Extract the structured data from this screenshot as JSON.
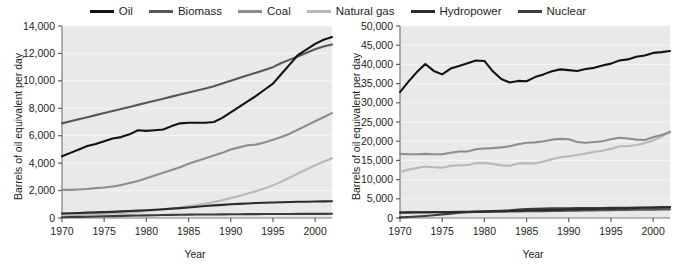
{
  "legend": {
    "items": [
      {
        "label": "Oil",
        "color": "#15110f",
        "name": "legend-item-oil"
      },
      {
        "label": "Biomass",
        "color": "#58565a",
        "name": "legend-item-biomass"
      },
      {
        "label": "Coal",
        "color": "#8e8c90",
        "name": "legend-item-coal"
      },
      {
        "label": "Natural gas",
        "color": "#b9b7bb",
        "name": "legend-item-natural-gas"
      },
      {
        "label": "Hydropower",
        "color": "#2d2a2c",
        "name": "legend-item-hydropower"
      },
      {
        "label": "Nuclear",
        "color": "#3e3c3f",
        "name": "legend-item-nuclear"
      }
    ]
  },
  "chart_data": [
    {
      "type": "line",
      "panel": "left",
      "title": "",
      "xlabel": "Year",
      "ylabel": "Barrels of oil equivalent per day",
      "xlim": [
        1970,
        2002
      ],
      "ylim": [
        0,
        14000
      ],
      "xticks": [
        1970,
        1975,
        1980,
        1985,
        1990,
        1995,
        2000
      ],
      "yticks": [
        0,
        2000,
        4000,
        6000,
        8000,
        10000,
        12000,
        14000
      ],
      "ytick_labels": [
        "0",
        "2,000",
        "4,000",
        "6,000",
        "8,000",
        "10,000",
        "12,000",
        "14,000"
      ],
      "xtick_labels": [
        "1970",
        "1975",
        "1980",
        "1985",
        "1990",
        "1995",
        "2000"
      ],
      "grid": true,
      "legend_position": "top-center",
      "x": [
        1970,
        1971,
        1972,
        1973,
        1974,
        1975,
        1976,
        1977,
        1978,
        1979,
        1980,
        1981,
        1982,
        1983,
        1984,
        1985,
        1986,
        1987,
        1988,
        1989,
        1990,
        1991,
        1992,
        1993,
        1994,
        1995,
        1996,
        1997,
        1998,
        1999,
        2000,
        2001,
        2002
      ],
      "series": [
        {
          "name": "Oil",
          "color": "#15110f",
          "values": [
            4500,
            4750,
            5000,
            5250,
            5400,
            5600,
            5800,
            5900,
            6100,
            6400,
            6350,
            6400,
            6450,
            6700,
            6900,
            6950,
            6950,
            6950,
            7000,
            7300,
            7700,
            8100,
            8500,
            8900,
            9350,
            9800,
            10500,
            11200,
            11900,
            12300,
            12700,
            13000,
            13200
          ]
        },
        {
          "name": "Biomass",
          "color": "#58565a",
          "values": [
            6900,
            7050,
            7200,
            7350,
            7500,
            7650,
            7800,
            7950,
            8100,
            8250,
            8400,
            8550,
            8700,
            8850,
            9000,
            9150,
            9300,
            9450,
            9600,
            9800,
            10000,
            10200,
            10400,
            10600,
            10800,
            11000,
            11300,
            11550,
            11800,
            12050,
            12300,
            12500,
            12650
          ]
        },
        {
          "name": "Coal",
          "color": "#8e8c90",
          "values": [
            2050,
            2050,
            2080,
            2120,
            2180,
            2220,
            2300,
            2400,
            2550,
            2700,
            2900,
            3100,
            3300,
            3500,
            3700,
            3950,
            4150,
            4350,
            4550,
            4750,
            5000,
            5150,
            5300,
            5350,
            5500,
            5700,
            5900,
            6150,
            6450,
            6750,
            7050,
            7350,
            7650
          ]
        },
        {
          "name": "Natural gas",
          "color": "#b9b7bb",
          "values": [
            220,
            230,
            245,
            260,
            280,
            300,
            330,
            360,
            400,
            450,
            500,
            560,
            620,
            690,
            760,
            850,
            950,
            1050,
            1170,
            1300,
            1450,
            1600,
            1780,
            1960,
            2150,
            2380,
            2650,
            2950,
            3250,
            3550,
            3850,
            4100,
            4350
          ]
        },
        {
          "name": "Hydropower",
          "color": "#2d2a2c",
          "values": [
            330,
            350,
            370,
            390,
            410,
            430,
            450,
            480,
            510,
            540,
            570,
            600,
            640,
            680,
            720,
            770,
            820,
            870,
            920,
            960,
            1000,
            1030,
            1060,
            1090,
            1110,
            1130,
            1150,
            1170,
            1180,
            1190,
            1200,
            1210,
            1220
          ]
        },
        {
          "name": "Nuclear",
          "color": "#3e3c3f",
          "values": [
            60,
            70,
            80,
            95,
            110,
            125,
            140,
            155,
            170,
            185,
            195,
            205,
            215,
            225,
            235,
            245,
            250,
            255,
            260,
            265,
            270,
            275,
            280,
            285,
            290,
            292,
            294,
            296,
            298,
            300,
            302,
            304,
            306
          ]
        }
      ]
    },
    {
      "type": "line",
      "panel": "right",
      "title": "",
      "xlabel": "Year",
      "ylabel": "Barrels of oil equivalent per day",
      "xlim": [
        1970,
        2002
      ],
      "ylim": [
        0,
        50000
      ],
      "xticks": [
        1970,
        1975,
        1980,
        1985,
        1990,
        1995,
        2000
      ],
      "yticks": [
        0,
        5000,
        10000,
        15000,
        20000,
        25000,
        30000,
        35000,
        40000,
        45000,
        50000
      ],
      "ytick_labels": [
        "0",
        "5,000",
        "10,000",
        "15,000",
        "20,000",
        "25,000",
        "30,000",
        "35,000",
        "40,000",
        "45,000",
        "50,000"
      ],
      "xtick_labels": [
        "1970",
        "1975",
        "1980",
        "1985",
        "1990",
        "1995",
        "2000"
      ],
      "grid": true,
      "legend_position": "top-center",
      "x": [
        1970,
        1971,
        1972,
        1973,
        1974,
        1975,
        1976,
        1977,
        1978,
        1979,
        1980,
        1981,
        1982,
        1983,
        1984,
        1985,
        1986,
        1987,
        1988,
        1989,
        1990,
        1991,
        1992,
        1993,
        1994,
        1995,
        1996,
        1997,
        1998,
        1999,
        2000,
        2001,
        2002
      ],
      "series": [
        {
          "name": "Oil",
          "color": "#15110f",
          "values": [
            32800,
            35500,
            38000,
            40100,
            38300,
            37400,
            38900,
            39600,
            40300,
            41000,
            40900,
            38200,
            36200,
            35300,
            35700,
            35600,
            36700,
            37400,
            38200,
            38700,
            38500,
            38300,
            38800,
            39100,
            39700,
            40200,
            41000,
            41300,
            42000,
            42300,
            43000,
            43200,
            43500
          ]
        },
        {
          "name": "Coal",
          "color": "#8e8c90",
          "values": [
            16700,
            16600,
            16600,
            16700,
            16600,
            16600,
            17000,
            17300,
            17300,
            17900,
            18100,
            18200,
            18400,
            18700,
            19200,
            19600,
            19700,
            20000,
            20400,
            20600,
            20500,
            19800,
            19600,
            19800,
            20000,
            20500,
            20900,
            20700,
            20400,
            20300,
            21000,
            21600,
            22300
          ]
        },
        {
          "name": "Natural gas",
          "color": "#b9b7bb",
          "values": [
            12000,
            12600,
            13000,
            13400,
            13200,
            13100,
            13600,
            13700,
            13800,
            14300,
            14300,
            14100,
            13700,
            13600,
            14200,
            14300,
            14200,
            14700,
            15300,
            15800,
            16100,
            16400,
            16800,
            17200,
            17500,
            18000,
            18700,
            18700,
            19000,
            19500,
            20200,
            21200,
            22600
          ]
        },
        {
          "name": "Biomass",
          "color": "#58565a",
          "values": [
            1400,
            1420,
            1440,
            1460,
            1480,
            1500,
            1520,
            1540,
            1560,
            1580,
            1600,
            1620,
            1650,
            1680,
            1710,
            1740,
            1770,
            1800,
            1830,
            1860,
            1890,
            1920,
            1950,
            1980,
            2010,
            2040,
            2070,
            2100,
            2130,
            2160,
            2190,
            2220,
            2250
          ]
        },
        {
          "name": "Hydropower",
          "color": "#2d2a2c",
          "values": [
            1450,
            1470,
            1490,
            1510,
            1530,
            1560,
            1580,
            1610,
            1640,
            1670,
            1700,
            1740,
            1780,
            1830,
            1880,
            1950,
            2000,
            2050,
            2100,
            2150,
            2200,
            2250,
            2300,
            2350,
            2400,
            2450,
            2500,
            2550,
            2600,
            2650,
            2700,
            2760,
            2820
          ]
        },
        {
          "name": "Nuclear",
          "color": "#3e3c3f",
          "values": [
            150,
            250,
            380,
            520,
            700,
            950,
            1150,
            1350,
            1500,
            1600,
            1700,
            1800,
            1900,
            2000,
            2200,
            2350,
            2400,
            2450,
            2500,
            2520,
            2550,
            2570,
            2590,
            2600,
            2620,
            2640,
            2660,
            2680,
            2700,
            2720,
            2740,
            2760,
            2780
          ]
        }
      ]
    }
  ]
}
